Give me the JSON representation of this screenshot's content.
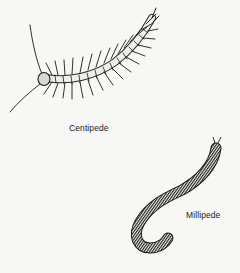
{
  "figure": {
    "items": [
      {
        "name": "centipede",
        "label": "Centipede"
      },
      {
        "name": "millipede",
        "label": "Millipede"
      }
    ],
    "colors": {
      "background": "#f7f7f5",
      "ink": "#1a1a1a"
    }
  }
}
